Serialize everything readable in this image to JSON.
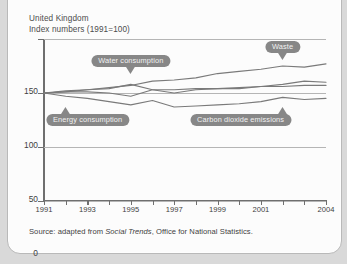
{
  "card": {
    "header_line1": "United Kingdom",
    "header_line2": "Index numbers (1991=100)",
    "source_prefix": "Source: adapted from ",
    "source_italic": "Social Trends",
    "source_suffix": ", Office for National Statistics."
  },
  "colors": {
    "page_background": "#d9d9d9",
    "card_background": "#fcfcfc",
    "card_border": "#b9b9b9",
    "line": "#7a7a7a",
    "axis": "#6f6f6f",
    "gridline": "#b5b5b5",
    "callout": "#878787",
    "callout_text": "#f2f2f2",
    "text": "#3f3f3f"
  },
  "chart_data": {
    "type": "line",
    "title": "United Kingdom",
    "subtitle": "Index numbers (1991=100)",
    "xlabel": "",
    "ylabel": "",
    "xlim": [
      1991,
      2004
    ],
    "ylim": [
      0,
      150
    ],
    "yticks": [
      0,
      50,
      100,
      150
    ],
    "ytick_labels": [
      "0",
      "50",
      "100",
      "150"
    ],
    "x": [
      1991,
      1992,
      1993,
      1994,
      1995,
      1996,
      1997,
      1998,
      1999,
      2000,
      2001,
      2002,
      2003,
      2004
    ],
    "xtick_labels": [
      "1991",
      "",
      "1993",
      "",
      "1995",
      "",
      "1997",
      "",
      "1999",
      "",
      "2001",
      "",
      "",
      "2004"
    ],
    "grid": true,
    "grid_axis": "y",
    "legend": "none",
    "legend_style": "inline-callout-labels",
    "series": [
      {
        "name": "Waste",
        "values": [
          100,
          101,
          103,
          105,
          107,
          111,
          112,
          114,
          118,
          120,
          122,
          125,
          124,
          127
        ]
      },
      {
        "name": "Water consumption",
        "values": [
          100,
          102,
          103,
          104,
          108,
          103,
          100,
          103,
          104,
          104,
          106,
          108,
          111,
          110
        ]
      },
      {
        "name": "Energy consumption",
        "values": [
          100,
          101,
          101,
          100,
          97,
          103,
          103,
          104,
          104,
          105,
          106,
          106,
          107,
          107
        ]
      },
      {
        "name": "Carbon dioxide emissions",
        "values": [
          100,
          97,
          95,
          92,
          89,
          93,
          87,
          88,
          89,
          90,
          92,
          96,
          94,
          95
        ]
      }
    ],
    "annotations": [
      {
        "label": "Waste",
        "points_to_year": 2002,
        "pointer": "down"
      },
      {
        "label": "Water consumption",
        "points_to_year": 1995,
        "pointer": "down"
      },
      {
        "label": "Energy consumption",
        "points_to_year": 1992,
        "pointer": "up"
      },
      {
        "label": "Carbon dioxide emissions",
        "points_to_year": 2002,
        "pointer": "up"
      }
    ]
  }
}
